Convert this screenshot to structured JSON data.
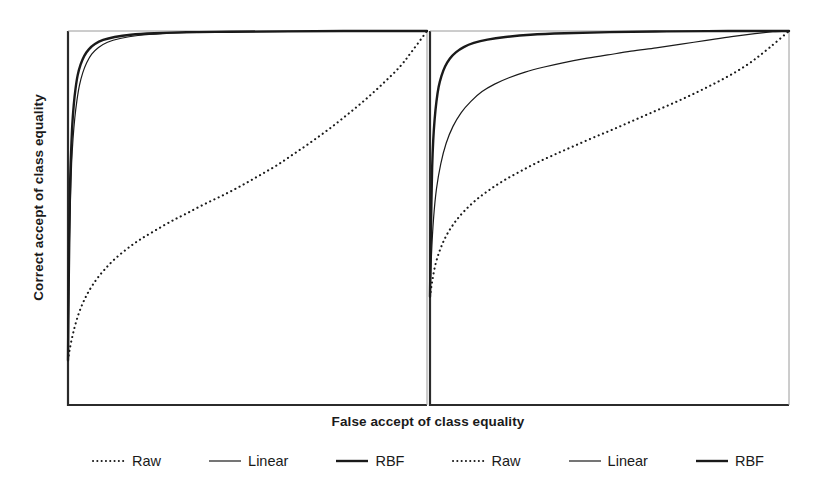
{
  "figure": {
    "xlabel": "False accept of class equality",
    "ylabel": "Correct accept of class equality",
    "line_color": "#1a1a1a",
    "axis_color": "#2b2b2b",
    "background": "#ffffff"
  },
  "legend": {
    "items": [
      {
        "label": "Raw",
        "style": "dotted",
        "width": 2.0,
        "panel": "left"
      },
      {
        "label": "Linear",
        "style": "solid",
        "width": 1.2,
        "panel": "left"
      },
      {
        "label": "RBF",
        "style": "solid",
        "width": 2.4,
        "panel": "left"
      },
      {
        "label": "Raw",
        "style": "dotted",
        "width": 2.0,
        "panel": "right"
      },
      {
        "label": "Linear",
        "style": "solid",
        "width": 1.2,
        "panel": "right"
      },
      {
        "label": "RBF",
        "style": "solid",
        "width": 2.4,
        "panel": "right"
      }
    ]
  },
  "chart_data": {
    "type": "line",
    "title": "",
    "xlabel": "False accept of class equality",
    "ylabel": "Correct accept of class equality",
    "xlim": [
      0,
      1
    ],
    "ylim": [
      0,
      1
    ],
    "grid": false,
    "legend_position": "below",
    "panels": [
      {
        "name": "left-panel",
        "series": [
          {
            "name": "Raw",
            "style": "dotted",
            "x": [
              0.0,
              0.005,
              0.015,
              0.03,
              0.05,
              0.075,
              0.1,
              0.13,
              0.165,
              0.2,
              0.24,
              0.285,
              0.33,
              0.38,
              0.43,
              0.48,
              0.53,
              0.58,
              0.63,
              0.68,
              0.73,
              0.78,
              0.83,
              0.88,
              0.925,
              0.96,
              1.0
            ],
            "y": [
              0.12,
              0.15,
              0.195,
              0.245,
              0.29,
              0.33,
              0.36,
              0.39,
              0.418,
              0.442,
              0.465,
              0.49,
              0.512,
              0.537,
              0.56,
              0.585,
              0.612,
              0.64,
              0.672,
              0.705,
              0.74,
              0.778,
              0.818,
              0.862,
              0.905,
              0.948,
              1.0
            ]
          },
          {
            "name": "Linear",
            "style": "solid",
            "x": [
              0.0,
              0.002,
              0.004,
              0.007,
              0.01,
              0.014,
              0.019,
              0.025,
              0.032,
              0.041,
              0.052,
              0.066,
              0.085,
              0.11,
              0.145,
              0.195,
              0.265,
              0.36,
              0.49,
              0.65,
              0.82,
              1.0
            ],
            "y": [
              0.12,
              0.3,
              0.44,
              0.56,
              0.645,
              0.712,
              0.768,
              0.815,
              0.855,
              0.888,
              0.915,
              0.938,
              0.956,
              0.97,
              0.98,
              0.988,
              0.993,
              0.996,
              0.998,
              0.999,
              1.0,
              1.0
            ]
          },
          {
            "name": "RBF",
            "style": "solid",
            "x": [
              0.0,
              0.002,
              0.004,
              0.006,
              0.009,
              0.012,
              0.016,
              0.021,
              0.027,
              0.035,
              0.045,
              0.058,
              0.075,
              0.098,
              0.13,
              0.175,
              0.24,
              0.33,
              0.45,
              0.61,
              0.8,
              1.0
            ],
            "y": [
              0.12,
              0.33,
              0.48,
              0.598,
              0.685,
              0.75,
              0.802,
              0.846,
              0.882,
              0.91,
              0.933,
              0.951,
              0.965,
              0.976,
              0.984,
              0.99,
              0.994,
              0.997,
              0.998,
              0.999,
              1.0,
              1.0
            ]
          }
        ]
      },
      {
        "name": "right-panel",
        "series": [
          {
            "name": "Raw",
            "style": "dotted",
            "x": [
              0.0,
              0.006,
              0.015,
              0.028,
              0.045,
              0.068,
              0.095,
              0.128,
              0.165,
              0.205,
              0.25,
              0.298,
              0.348,
              0.4,
              0.455,
              0.51,
              0.565,
              0.62,
              0.675,
              0.73,
              0.785,
              0.84,
              0.893,
              0.945,
              1.0
            ],
            "y": [
              0.29,
              0.33,
              0.375,
              0.415,
              0.452,
              0.487,
              0.518,
              0.548,
              0.575,
              0.6,
              0.624,
              0.648,
              0.67,
              0.692,
              0.715,
              0.737,
              0.76,
              0.783,
              0.806,
              0.83,
              0.856,
              0.884,
              0.916,
              0.955,
              1.0
            ]
          },
          {
            "name": "Linear",
            "style": "solid",
            "x": [
              0.0,
              0.004,
              0.01,
              0.018,
              0.03,
              0.045,
              0.064,
              0.087,
              0.114,
              0.145,
              0.18,
              0.22,
              0.265,
              0.315,
              0.37,
              0.43,
              0.495,
              0.56,
              0.63,
              0.7,
              0.77,
              0.84,
              0.905,
              0.955,
              1.0
            ],
            "y": [
              0.29,
              0.4,
              0.5,
              0.578,
              0.645,
              0.7,
              0.745,
              0.782,
              0.812,
              0.838,
              0.858,
              0.875,
              0.89,
              0.903,
              0.915,
              0.926,
              0.936,
              0.946,
              0.955,
              0.965,
              0.975,
              0.985,
              0.993,
              0.998,
              1.0
            ]
          },
          {
            "name": "RBF",
            "style": "solid",
            "x": [
              0.0,
              0.002,
              0.004,
              0.006,
              0.009,
              0.013,
              0.018,
              0.024,
              0.032,
              0.042,
              0.055,
              0.072,
              0.094,
              0.122,
              0.16,
              0.21,
              0.28,
              0.375,
              0.5,
              0.66,
              0.83,
              1.0
            ],
            "y": [
              0.29,
              0.43,
              0.545,
              0.635,
              0.708,
              0.765,
              0.812,
              0.85,
              0.88,
              0.905,
              0.926,
              0.943,
              0.957,
              0.968,
              0.977,
              0.984,
              0.99,
              0.994,
              0.997,
              0.999,
              1.0,
              1.0
            ]
          }
        ]
      }
    ]
  }
}
